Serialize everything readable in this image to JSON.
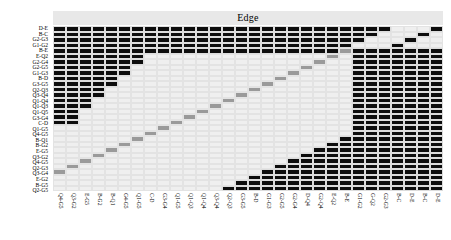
{
  "chart": {
    "title": "Edge",
    "type": "heatmap"
  },
  "chart_data": {
    "type": "heatmap",
    "title": "Edge",
    "xlabel": "",
    "ylabel": "",
    "grid": true,
    "legend": "none",
    "colors": {
      "background": "#e9e9e9",
      "empty": "#efefef",
      "filled": "#0d0d0d",
      "diagonal": "#9a9a9a",
      "title_band": "#e8e8e8"
    },
    "value_levels": {
      "empty": 0,
      "diagonal": 0.5,
      "filled": 1
    },
    "x": [
      "Q4-G5",
      "Q3-G2",
      "E-G5",
      "B-G2",
      "B-Q1",
      "G4-G5",
      "Q1-G5",
      "C-D",
      "G3-G4",
      "Q1-G5",
      "Q1-Q3",
      "Q1-Q4",
      "Q3-Q4",
      "Q2-Q3",
      "G3-G5",
      "B-D",
      "G1-G3",
      "G2-G5",
      "G2-G4",
      "D-Q4",
      "G2-Q4",
      "E-Q2",
      "B-E",
      "G1-G2",
      "G-Q2",
      "G2-G3",
      "B-C",
      "D-E",
      "B-C",
      "D-E"
    ],
    "y": [
      "D-E",
      "B-C",
      "G2-G3",
      "G1-G2",
      "B-E",
      "E-Q2",
      "G2-G4",
      "G2-G5",
      "G1-G3",
      "B-D",
      "G3-G5",
      "Q2-Q3",
      "Q3-Q4",
      "Q1-Q4",
      "Q1-Q3",
      "Q1-Q5",
      "G3-G4",
      "C-D",
      "Q1-G5",
      "Q4-G5",
      "B-Q1",
      "B-G2",
      "E-G5",
      "Q3-G2",
      "Q4-G5",
      "Q2-G3",
      "Q3-G4",
      "E-G2",
      "B-G5",
      "Q2-G5"
    ],
    "matrix": [
      [
        1,
        1,
        1,
        1,
        1,
        1,
        1,
        1,
        1,
        1,
        1,
        1,
        1,
        1,
        1,
        1,
        1,
        1,
        1,
        1,
        1,
        1,
        1,
        1,
        1,
        1,
        0,
        0,
        0,
        1
      ],
      [
        1,
        1,
        1,
        1,
        1,
        1,
        1,
        1,
        1,
        1,
        1,
        1,
        1,
        1,
        1,
        1,
        1,
        1,
        1,
        1,
        1,
        1,
        1,
        1,
        1,
        0,
        0,
        0,
        1,
        0
      ],
      [
        1,
        1,
        1,
        1,
        1,
        1,
        1,
        1,
        1,
        1,
        1,
        1,
        1,
        1,
        1,
        1,
        1,
        1,
        1,
        1,
        1,
        1,
        1,
        1,
        0,
        0,
        0,
        1,
        0,
        0
      ],
      [
        1,
        1,
        1,
        1,
        1,
        1,
        1,
        1,
        1,
        1,
        1,
        1,
        1,
        1,
        1,
        1,
        1,
        1,
        1,
        1,
        1,
        1,
        1,
        0,
        0,
        0,
        1,
        0,
        0,
        0
      ],
      [
        1,
        1,
        1,
        1,
        1,
        1,
        1,
        1,
        1,
        1,
        1,
        1,
        1,
        1,
        1,
        1,
        1,
        1,
        1,
        1,
        1,
        1,
        0.5,
        1,
        1,
        1,
        1,
        1,
        1,
        1
      ],
      [
        1,
        1,
        1,
        1,
        1,
        1,
        1,
        0,
        0,
        0,
        0,
        0,
        0,
        0,
        0,
        0,
        0,
        0,
        0,
        0,
        0,
        0.5,
        0,
        1,
        1,
        1,
        1,
        1,
        1,
        1
      ],
      [
        1,
        1,
        1,
        1,
        1,
        1,
        1,
        0,
        0,
        0,
        0,
        0,
        0,
        0,
        0,
        0,
        0,
        0,
        0,
        0,
        0.5,
        0,
        0,
        1,
        1,
        1,
        1,
        1,
        1,
        1
      ],
      [
        1,
        1,
        1,
        1,
        1,
        1,
        0,
        0,
        0,
        0,
        0,
        0,
        0,
        0,
        0,
        0,
        0,
        0,
        0,
        0.5,
        0,
        0,
        0,
        1,
        1,
        1,
        1,
        1,
        1,
        1
      ],
      [
        1,
        1,
        1,
        1,
        1,
        1,
        0,
        0,
        0,
        0,
        0,
        0,
        0,
        0,
        0,
        0,
        0,
        0,
        0.5,
        0,
        0,
        0,
        0,
        1,
        1,
        1,
        1,
        1,
        1,
        1
      ],
      [
        1,
        1,
        1,
        1,
        1,
        0,
        0,
        0,
        0,
        0,
        0,
        0,
        0,
        0,
        0,
        0,
        0,
        0.5,
        0,
        0,
        0,
        0,
        0,
        1,
        1,
        1,
        1,
        1,
        1,
        1
      ],
      [
        1,
        1,
        1,
        1,
        1,
        0,
        0,
        0,
        0,
        0,
        0,
        0,
        0,
        0,
        0,
        0,
        0.5,
        0,
        0,
        0,
        0,
        0,
        0,
        1,
        1,
        1,
        1,
        1,
        1,
        1
      ],
      [
        1,
        1,
        1,
        1,
        0,
        0,
        0,
        0,
        0,
        0,
        0,
        0,
        0,
        0,
        0,
        0.5,
        0,
        0,
        0,
        0,
        0,
        0,
        0,
        1,
        1,
        1,
        1,
        1,
        1,
        1
      ],
      [
        1,
        1,
        1,
        1,
        0,
        0,
        0,
        0,
        0,
        0,
        0,
        0,
        0,
        0,
        0.5,
        0,
        0,
        0,
        0,
        0,
        0,
        0,
        0,
        1,
        1,
        1,
        1,
        1,
        1,
        1
      ],
      [
        1,
        1,
        1,
        0,
        0,
        0,
        0,
        0,
        0,
        0,
        0,
        0,
        0,
        0.5,
        0,
        0,
        0,
        0,
        0,
        0,
        0,
        0,
        0,
        1,
        1,
        1,
        1,
        1,
        1,
        1
      ],
      [
        1,
        1,
        1,
        0,
        0,
        0,
        0,
        0,
        0,
        0,
        0,
        0,
        0.5,
        0,
        0,
        0,
        0,
        0,
        0,
        0,
        0,
        0,
        0,
        1,
        1,
        1,
        1,
        1,
        1,
        1
      ],
      [
        1,
        1,
        0,
        0,
        0,
        0,
        0,
        0,
        0,
        0,
        0,
        0.5,
        0,
        0,
        0,
        0,
        0,
        0,
        0,
        0,
        0,
        0,
        0,
        1,
        1,
        1,
        1,
        1,
        1,
        1
      ],
      [
        1,
        1,
        0,
        0,
        0,
        0,
        0,
        0,
        0,
        0,
        0.5,
        0,
        0,
        0,
        0,
        0,
        0,
        0,
        0,
        0,
        0,
        0,
        0,
        1,
        1,
        1,
        1,
        1,
        1,
        1
      ],
      [
        1,
        1,
        0,
        0,
        0,
        0,
        0,
        0,
        0,
        0.5,
        0,
        0,
        0,
        0,
        0,
        0,
        0,
        0,
        0,
        0,
        0,
        0,
        0,
        1,
        1,
        1,
        1,
        1,
        1,
        1
      ],
      [
        0,
        0,
        0,
        0,
        0,
        0,
        0,
        0,
        0.5,
        0,
        0,
        0,
        0,
        0,
        0,
        0,
        0,
        0,
        0,
        0,
        0,
        0,
        0,
        1,
        1,
        1,
        1,
        1,
        1,
        1
      ],
      [
        0,
        0,
        0,
        0,
        0,
        0,
        0,
        0.5,
        0,
        0,
        0,
        0,
        0,
        0,
        0,
        0,
        0,
        0,
        0,
        0,
        0,
        0,
        0,
        1,
        1,
        1,
        1,
        1,
        1,
        1
      ],
      [
        0,
        0,
        0,
        0,
        0,
        0,
        0.5,
        0,
        0,
        0,
        0,
        0,
        0,
        0,
        0,
        0,
        0,
        0,
        0,
        0,
        0,
        0,
        1,
        1,
        1,
        1,
        1,
        1,
        1,
        1
      ],
      [
        0,
        0,
        0,
        0,
        0,
        0.5,
        0,
        0,
        0,
        0,
        0,
        0,
        0,
        0,
        0,
        0,
        0,
        0,
        0,
        0,
        0,
        1,
        1,
        1,
        1,
        1,
        1,
        1,
        1,
        1
      ],
      [
        0,
        0,
        0,
        0,
        0.5,
        0,
        0,
        0,
        0,
        0,
        0,
        0,
        0,
        0,
        0,
        0,
        0,
        0,
        0,
        0,
        1,
        1,
        1,
        1,
        1,
        1,
        1,
        1,
        1,
        1
      ],
      [
        0,
        0,
        0,
        0.5,
        0,
        0,
        0,
        0,
        0,
        0,
        0,
        0,
        0,
        0,
        0,
        0,
        0,
        0,
        0,
        1,
        1,
        1,
        1,
        1,
        1,
        1,
        1,
        1,
        1,
        1
      ],
      [
        0,
        0,
        0.5,
        0,
        0,
        0,
        0,
        0,
        0,
        0,
        0,
        0,
        0,
        0,
        0,
        0,
        0,
        0,
        1,
        1,
        1,
        1,
        1,
        1,
        1,
        1,
        1,
        1,
        1,
        1
      ],
      [
        0,
        0.5,
        0,
        0,
        0,
        0,
        0,
        0,
        0,
        0,
        0,
        0,
        0,
        0,
        0,
        0,
        0,
        1,
        1,
        1,
        1,
        1,
        1,
        1,
        1,
        1,
        1,
        1,
        1,
        1
      ],
      [
        0.5,
        0,
        0,
        0,
        0,
        0,
        0,
        0,
        0,
        0,
        0,
        0,
        0,
        0,
        0,
        0,
        1,
        1,
        1,
        1,
        1,
        1,
        1,
        1,
        1,
        1,
        1,
        1,
        1,
        1
      ],
      [
        0,
        0,
        0,
        0,
        0,
        0,
        0,
        0,
        0,
        0,
        0,
        0,
        0,
        0,
        0,
        1,
        1,
        1,
        1,
        1,
        1,
        1,
        1,
        1,
        1,
        1,
        1,
        1,
        1,
        1
      ],
      [
        0,
        0,
        0,
        0,
        0,
        0,
        0,
        0,
        0,
        0,
        0,
        0,
        0,
        0,
        1,
        1,
        1,
        1,
        1,
        1,
        1,
        1,
        1,
        1,
        1,
        1,
        1,
        1,
        1,
        1
      ],
      [
        0,
        0,
        0,
        0,
        0,
        0,
        0,
        0,
        0,
        0,
        0,
        0,
        0,
        1,
        1,
        1,
        1,
        1,
        1,
        1,
        1,
        1,
        1,
        1,
        1,
        1,
        1,
        1,
        1,
        1
      ]
    ]
  }
}
